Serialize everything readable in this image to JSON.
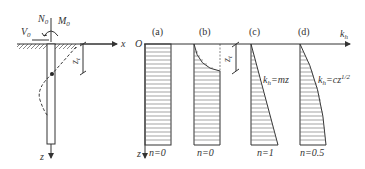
{
  "pile": {
    "loads": {
      "N": "N",
      "N_sub": "0",
      "M": "M",
      "M_sub": "0",
      "V": "V",
      "V_sub": "0"
    },
    "x_axis_label": "x",
    "z_axis_label": "z",
    "depth_label": "z",
    "depth_sub": "t"
  },
  "profiles": {
    "origin_label": "O",
    "kh_axis_label": "k",
    "kh_axis_sub": "h",
    "z_axis_label": "z",
    "panels": [
      {
        "tag": "(a)",
        "n_label": "n=0"
      },
      {
        "tag": "(b)",
        "n_label": "n=0",
        "depth_label": "z",
        "depth_sub": "t"
      },
      {
        "tag": "(c)",
        "n_label": "n=1",
        "formula_k": "k",
        "formula_sub": "h",
        "formula_rhs": "=mz"
      },
      {
        "tag": "(d)",
        "n_label": "n=0.5",
        "formula_k": "k",
        "formula_sub": "h",
        "formula_rhs": "=cz",
        "formula_exp": "1/2"
      }
    ]
  },
  "colors": {
    "line": "#333333",
    "hatch": "#666666",
    "background": "#ffffff"
  }
}
